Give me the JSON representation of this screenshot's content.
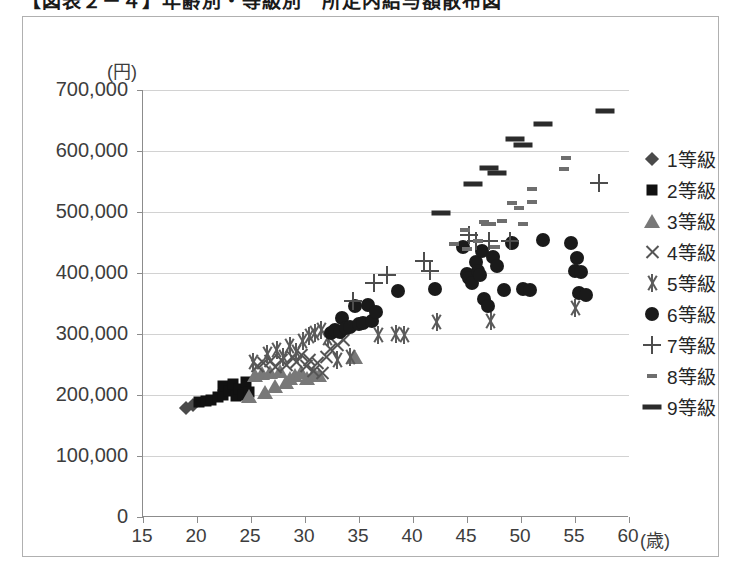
{
  "page": {
    "title_clipped": "【図表２－４】年齢別・等級別　所定内給与額散布図"
  },
  "chart_frame": {
    "border_color": "#b0b0b0"
  },
  "axes": {
    "y_unit_label": "(円)",
    "x_unit_label": "(歳)",
    "y_ticks": [
      "0",
      "100,000",
      "200,000",
      "300,000",
      "400,000",
      "500,000",
      "600,000",
      "700,000"
    ],
    "x_ticks": [
      "15",
      "20",
      "25",
      "30",
      "35",
      "40",
      "45",
      "50",
      "55",
      "60"
    ]
  },
  "legend": {
    "position": "right",
    "items": [
      {
        "label": "1等級",
        "marker": "diamond",
        "color": "#4a4a4a"
      },
      {
        "label": "2等級",
        "marker": "square",
        "color": "#111111"
      },
      {
        "label": "3等級",
        "marker": "triangle",
        "color": "#787878"
      },
      {
        "label": "4等級",
        "marker": "cross",
        "color": "#555555"
      },
      {
        "label": "5等級",
        "marker": "star",
        "color": "#5a5a5a"
      },
      {
        "label": "6等級",
        "marker": "circle",
        "color": "#1a1a1a"
      },
      {
        "label": "7等級",
        "marker": "plus",
        "color": "#4d4d4d"
      },
      {
        "label": "8等級",
        "marker": "dash8",
        "color": "#6e6e6e"
      },
      {
        "label": "9等級",
        "marker": "dash9",
        "color": "#2b2b2b"
      }
    ]
  },
  "chart_data": {
    "type": "scatter",
    "title": "【図表２－４】年齢別・等級別　所定内給与額散布図",
    "xlabel": "(歳)",
    "ylabel": "(円)",
    "xlim": [
      15,
      60
    ],
    "ylim": [
      0,
      700000
    ],
    "xtick_step": 5,
    "ytick_step": 100000,
    "grid": "horizontal",
    "legend_position": "right",
    "series": [
      {
        "name": "1等級",
        "marker": "diamond",
        "color": "#4a4a4a",
        "points": [
          [
            19.0,
            178000
          ],
          [
            19.6,
            183000
          ]
        ]
      },
      {
        "name": "2等級",
        "marker": "square",
        "color": "#111111",
        "points": [
          [
            20.2,
            188000
          ],
          [
            20.8,
            190000
          ],
          [
            21.3,
            192000
          ],
          [
            21.9,
            196000
          ],
          [
            22.4,
            200000
          ],
          [
            22.4,
            214000
          ],
          [
            23.0,
            206000
          ],
          [
            23.3,
            218000
          ],
          [
            23.6,
            198000
          ],
          [
            23.9,
            210000
          ],
          [
            24.3,
            200000
          ],
          [
            24.5,
            222000
          ],
          [
            24.8,
            205000
          ]
        ]
      },
      {
        "name": "3等級",
        "marker": "triangle",
        "color": "#787878",
        "points": [
          [
            24.8,
            198000
          ],
          [
            25.4,
            232000
          ],
          [
            26.0,
            236000
          ],
          [
            26.3,
            205000
          ],
          [
            26.8,
            238000
          ],
          [
            27.2,
            214000
          ],
          [
            27.7,
            240000
          ],
          [
            28.2,
            222000
          ],
          [
            28.6,
            228000
          ],
          [
            29.1,
            232000
          ],
          [
            29.6,
            238000
          ],
          [
            30.2,
            228000
          ],
          [
            30.8,
            236000
          ],
          [
            31.3,
            232000
          ],
          [
            34.6,
            262000
          ]
        ]
      },
      {
        "name": "4等級",
        "marker": "cross",
        "color": "#555555",
        "points": [
          [
            25.6,
            248000
          ],
          [
            26.2,
            252000
          ],
          [
            26.8,
            256000
          ],
          [
            27.3,
            246000
          ],
          [
            27.8,
            258000
          ],
          [
            28.3,
            250000
          ],
          [
            28.8,
            262000
          ],
          [
            29.2,
            254000
          ],
          [
            29.7,
            266000
          ],
          [
            30.1,
            248000
          ],
          [
            30.4,
            258000
          ],
          [
            30.8,
            240000
          ],
          [
            31.2,
            252000
          ],
          [
            31.6,
            236000
          ],
          [
            32.0,
            262000
          ],
          [
            32.4,
            276000
          ],
          [
            33.0,
            282000
          ],
          [
            33.6,
            290000
          ]
        ]
      },
      {
        "name": "5等級",
        "marker": "star",
        "color": "#5a5a5a",
        "points": [
          [
            25.2,
            254000
          ],
          [
            26.5,
            268000
          ],
          [
            27.4,
            274000
          ],
          [
            28.0,
            262000
          ],
          [
            28.6,
            280000
          ],
          [
            29.2,
            270000
          ],
          [
            29.8,
            288000
          ],
          [
            30.4,
            296000
          ],
          [
            30.9,
            302000
          ],
          [
            31.5,
            306000
          ],
          [
            32.1,
            294000
          ],
          [
            33.0,
            258000
          ],
          [
            34.2,
            262000
          ],
          [
            36.8,
            298000
          ],
          [
            38.4,
            300000
          ],
          [
            39.2,
            298000
          ],
          [
            42.2,
            320000
          ],
          [
            47.2,
            322000
          ],
          [
            55.0,
            342000
          ]
        ]
      },
      {
        "name": "6等級",
        "marker": "circle",
        "color": "#1a1a1a",
        "points": [
          [
            32.4,
            302000
          ],
          [
            32.8,
            306000
          ],
          [
            33.2,
            304000
          ],
          [
            33.4,
            326000
          ],
          [
            33.8,
            310000
          ],
          [
            34.2,
            312000
          ],
          [
            34.6,
            346000
          ],
          [
            35.0,
            316000
          ],
          [
            35.4,
            318000
          ],
          [
            35.8,
            348000
          ],
          [
            36.2,
            322000
          ],
          [
            36.6,
            336000
          ],
          [
            38.6,
            370000
          ],
          [
            42.0,
            374000
          ],
          [
            44.6,
            442000
          ],
          [
            45.0,
            398000
          ],
          [
            45.2,
            392000
          ],
          [
            45.5,
            384000
          ],
          [
            45.8,
            418000
          ],
          [
            46.0,
            404000
          ],
          [
            46.2,
            396000
          ],
          [
            46.4,
            436000
          ],
          [
            46.6,
            358000
          ],
          [
            46.9,
            346000
          ],
          [
            47.4,
            426000
          ],
          [
            47.8,
            412000
          ],
          [
            48.4,
            372000
          ],
          [
            49.2,
            450000
          ],
          [
            50.2,
            374000
          ],
          [
            50.8,
            372000
          ],
          [
            52.0,
            454000
          ],
          [
            54.6,
            450000
          ],
          [
            55.2,
            424000
          ],
          [
            55.0,
            404000
          ],
          [
            55.6,
            402000
          ],
          [
            55.4,
            368000
          ],
          [
            56.0,
            364000
          ]
        ]
      },
      {
        "name": "7等級",
        "marker": "plus",
        "color": "#4d4d4d",
        "points": [
          [
            34.4,
            354000
          ],
          [
            36.4,
            384000
          ],
          [
            37.6,
            396000
          ],
          [
            41.0,
            420000
          ],
          [
            41.6,
            404000
          ],
          [
            45.2,
            462000
          ],
          [
            45.8,
            452000
          ],
          [
            47.0,
            452000
          ],
          [
            49.0,
            452000
          ],
          [
            57.2,
            548000
          ]
        ]
      },
      {
        "name": "8等級",
        "marker": "dash8",
        "color": "#6e6e6e",
        "points": [
          [
            43.8,
            448000
          ],
          [
            44.8,
            470000
          ],
          [
            45.0,
            440000
          ],
          [
            46.0,
            452000
          ],
          [
            46.6,
            484000
          ],
          [
            46.8,
            480000
          ],
          [
            47.2,
            480000
          ],
          [
            47.6,
            442000
          ],
          [
            48.2,
            486000
          ],
          [
            49.2,
            514000
          ],
          [
            49.8,
            506000
          ],
          [
            50.2,
            480000
          ],
          [
            51.0,
            538000
          ],
          [
            51.0,
            516000
          ],
          [
            54.2,
            588000
          ],
          [
            54.0,
            570000
          ]
        ]
      },
      {
        "name": "9等級",
        "marker": "dash9",
        "color": "#2b2b2b",
        "points": [
          [
            42.6,
            498000
          ],
          [
            45.6,
            546000
          ],
          [
            47.0,
            572000
          ],
          [
            47.8,
            564000
          ],
          [
            49.4,
            620000
          ],
          [
            50.2,
            610000
          ],
          [
            52.0,
            645000
          ],
          [
            57.8,
            665000
          ]
        ]
      }
    ]
  }
}
